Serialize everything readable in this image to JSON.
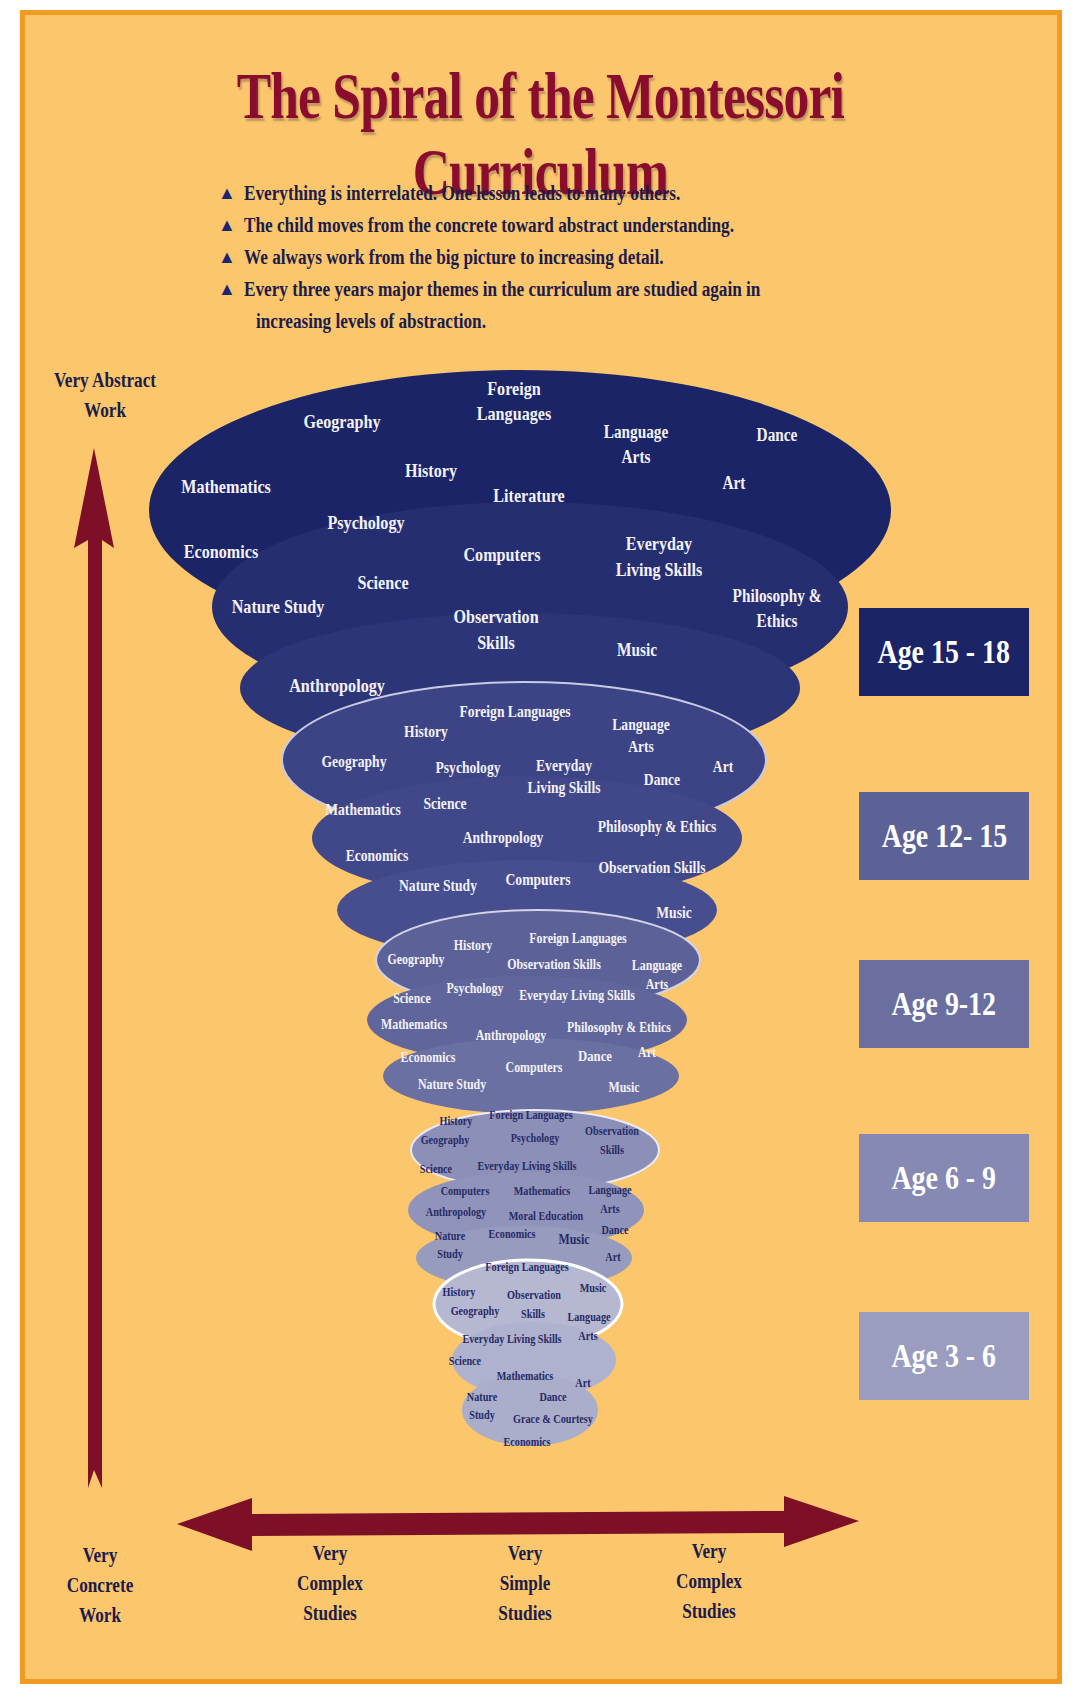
{
  "title": "The Spiral of the Montessori Curriculum",
  "bullets": [
    "Everything is interrelated. One lesson leads to many others.",
    "The child moves from the concrete toward abstract understanding.",
    "We always work from the big picture to increasing detail.",
    "Every three years major themes in the curriculum are studied again in",
    "increasing levels of abstraction."
  ],
  "bullet_icon": "triangle-up",
  "vertical_axis": {
    "top_label": "Very Abstract Work",
    "bottom_label": [
      "Very",
      "Concrete",
      "Work"
    ]
  },
  "horizontal_axis": {
    "labels": [
      [
        "Very",
        "Complex",
        "Studies"
      ],
      [
        "Very",
        "Simple",
        "Studies"
      ],
      [
        "Very",
        "Complex",
        "Studies"
      ]
    ]
  },
  "age_labels": [
    "Age 15 - 18",
    "Age 12- 15",
    "Age 9-12",
    "Age 6 - 9",
    "Age 3 - 6"
  ],
  "tiers": {
    "age_15_18": {
      "subjects": [
        "Foreign Languages",
        "Geography",
        "Language Arts",
        "Dance",
        "History",
        "Mathematics",
        "Art",
        "Literature",
        "Psychology",
        "Economics",
        "Computers",
        "Everyday Living Skills",
        "Science",
        "Nature Study",
        "Observation Skills",
        "Philosophy & Ethics",
        "Music",
        "Anthropology"
      ]
    },
    "age_12_15": {
      "subjects": [
        "Foreign Languages",
        "History",
        "Language Arts",
        "Geography",
        "Psychology",
        "Everyday Living Skills",
        "Art",
        "Dance",
        "Mathematics",
        "Science",
        "Philosophy & Ethics",
        "Anthropology",
        "Economics",
        "Observation Skills",
        "Nature Study",
        "Computers",
        "Music"
      ]
    },
    "age_9_12": {
      "subjects": [
        "History",
        "Foreign Languages",
        "Geography",
        "Observation Skills",
        "Language Arts",
        "Psychology",
        "Science",
        "Everyday Living Skills",
        "Mathematics",
        "Philosophy & Ethics",
        "Anthropology",
        "Art",
        "Economics",
        "Dance",
        "Computers",
        "Nature Study",
        "Music"
      ]
    },
    "age_6_9": {
      "subjects": [
        "History",
        "Foreign Languages",
        "Geography",
        "Psychology",
        "Observation Skills",
        "Science",
        "Everyday Living Skills",
        "Computers",
        "Mathematics",
        "Language Arts",
        "Anthropology",
        "Moral Education",
        "Nature Study",
        "Economics",
        "Music",
        "Dance",
        "Art"
      ]
    },
    "age_3_6": {
      "subjects": [
        "Foreign Languages",
        "History",
        "Observation Skills",
        "Music",
        "Geography",
        "Language Arts",
        "Everyday Living Skills",
        "Science",
        "Mathematics",
        "Art",
        "Nature Study",
        "Dance",
        "Grace & Courtesy",
        "Economics"
      ]
    }
  },
  "labels": {
    "t1": [
      "Foreign",
      "Languages",
      "Geography",
      "Language",
      "Arts",
      "Dance",
      "History",
      "Mathematics",
      "Art",
      "Literature",
      "Psychology",
      "Economics",
      "Computers",
      "Everyday",
      "Living Skills",
      "Science",
      "Nature Study",
      "Observation",
      "Skills",
      "Philosophy &",
      "Ethics",
      "Music",
      "Anthropology"
    ],
    "t2": [
      "Foreign Languages",
      "History",
      "Language",
      "Arts",
      "Geography",
      "Psychology",
      "Everyday",
      "Living Skills",
      "Art",
      "Dance",
      "Mathematics",
      "Science",
      "Philosophy & Ethics",
      "Anthropology",
      "Economics",
      "Observation Skills",
      "Nature Study",
      "Computers",
      "Music"
    ],
    "t3": [
      "History",
      "Foreign Languages",
      "Geography",
      "Observation Skills",
      "Language",
      "Arts",
      "Psychology",
      "Science",
      "Everyday Living Skills",
      "Mathematics",
      "Philosophy & Ethics",
      "Anthropology",
      "Art",
      "Economics",
      "Dance",
      "Computers",
      "Nature Study",
      "Music"
    ],
    "t4": [
      "History",
      "Foreign Languages",
      "Geography",
      "Psychology",
      "Observation",
      "Skills",
      "Science",
      "Everyday Living Skills",
      "Computers",
      "Mathematics",
      "Language",
      "Anthropology",
      "Arts",
      "Moral Education",
      "Nature",
      "Economics",
      "Music",
      "Dance",
      "Study",
      "Art"
    ],
    "t5": [
      "Foreign Languages",
      "History",
      "Observation",
      "Music",
      "Geography",
      "Skills",
      "Language",
      "Everyday Living Skills",
      "Arts",
      "Science",
      "Mathematics",
      "Art",
      "Nature",
      "Dance",
      "Study",
      "Grace & Courtesy",
      "Economics"
    ]
  },
  "colors": {
    "background": "#fbc66c",
    "border": "#f29b22",
    "title": "#8a0d2e",
    "arrow": "#7d0f26",
    "text_dark": "#1c1c4a",
    "tier1": "#1b2466",
    "tier2": "#3b4283",
    "tier3": "#6a6f9f",
    "tier4": "#8d91b7",
    "tier5": "#adb1cc",
    "age_15_18_box": "#1b2466",
    "age_12_15_box": "#5d6296",
    "age_9_12_box": "#6a6f9f",
    "age_6_9_box": "#8689b3",
    "age_3_6_box": "#9a9dc0"
  }
}
